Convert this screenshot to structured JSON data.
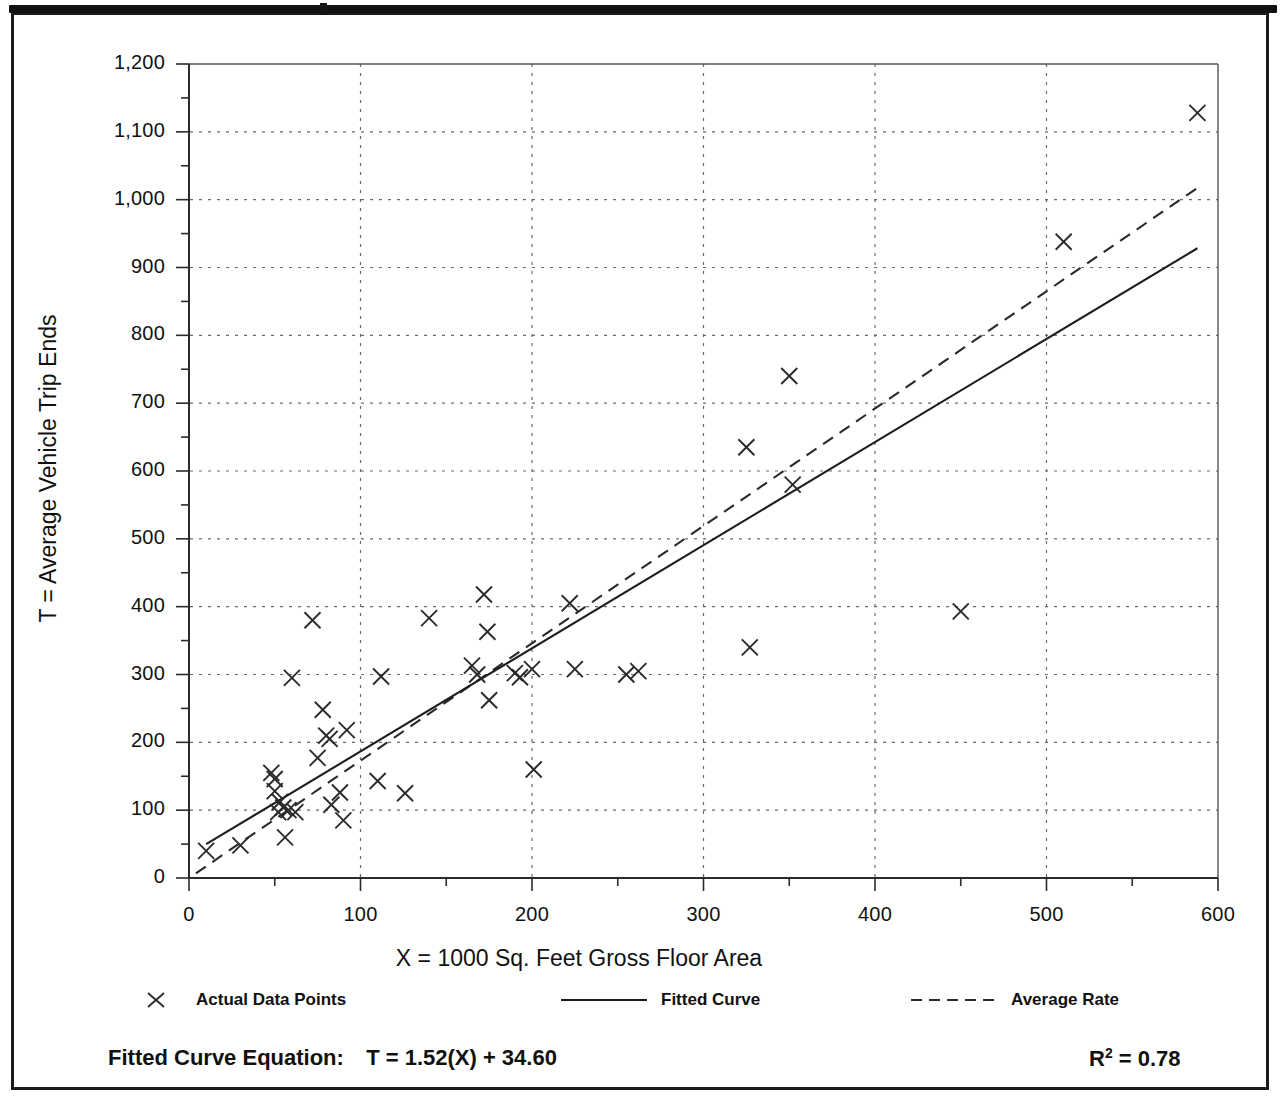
{
  "figure": {
    "frame_color": "#1a1a1a",
    "background": "#ffffff"
  },
  "axes": {
    "y_label": "T = Average Vehicle Trip Ends",
    "x_label": "X = 1000 Sq. Feet Gross Floor Area",
    "y_ticks": [
      "0",
      "100",
      "200",
      "300",
      "400",
      "500",
      "600",
      "700",
      "800",
      "900",
      "1,000",
      "1,100",
      "1,200"
    ],
    "x_ticks": [
      "0",
      "100",
      "200",
      "300",
      "400",
      "500",
      "600"
    ]
  },
  "legend": {
    "items": [
      {
        "label": "Actual Data Points",
        "symbol": "x-marker-icon"
      },
      {
        "label": "Fitted Curve",
        "symbol": "solid-line-icon"
      },
      {
        "label": "Average Rate",
        "symbol": "dashed-line-icon"
      }
    ]
  },
  "annotations": {
    "equation_label": "Fitted Curve Equation:",
    "equation": "T = 1.52(X) + 34.60",
    "r_squared_base": "R",
    "r_squared_exp": "2",
    "r_squared_value": "= 0.78"
  },
  "chart_data": {
    "type": "scatter",
    "title": "",
    "xlabel": "X = 1000 Sq. Feet Gross Floor Area",
    "ylabel": "T = Average Vehicle Trip Ends",
    "xlim": [
      0,
      600
    ],
    "ylim": [
      0,
      1200
    ],
    "x_major_step": 100,
    "y_major_step": 100,
    "x_minor_step": 50,
    "y_minor_step": 50,
    "grid": true,
    "grid_style": "dotted",
    "legend_position": "below-plot",
    "marker": "x",
    "points": [
      [
        10,
        40
      ],
      [
        30,
        48
      ],
      [
        48,
        155
      ],
      [
        50,
        146
      ],
      [
        50,
        128
      ],
      [
        52,
        97
      ],
      [
        53,
        112
      ],
      [
        55,
        104
      ],
      [
        56,
        60
      ],
      [
        58,
        100
      ],
      [
        60,
        295
      ],
      [
        62,
        97
      ],
      [
        72,
        380
      ],
      [
        75,
        177
      ],
      [
        78,
        248
      ],
      [
        80,
        210
      ],
      [
        82,
        205
      ],
      [
        83,
        108
      ],
      [
        88,
        126
      ],
      [
        90,
        85
      ],
      [
        92,
        218
      ],
      [
        110,
        143
      ],
      [
        112,
        297
      ],
      [
        126,
        125
      ],
      [
        140,
        383
      ],
      [
        165,
        313
      ],
      [
        168,
        300
      ],
      [
        172,
        418
      ],
      [
        174,
        363
      ],
      [
        175,
        262
      ],
      [
        190,
        302
      ],
      [
        193,
        296
      ],
      [
        200,
        308
      ],
      [
        201,
        160
      ],
      [
        222,
        405
      ],
      [
        225,
        308
      ],
      [
        255,
        300
      ],
      [
        262,
        305
      ],
      [
        325,
        635
      ],
      [
        327,
        340
      ],
      [
        350,
        740
      ],
      [
        352,
        580
      ],
      [
        450,
        393
      ],
      [
        510,
        938
      ],
      [
        588,
        1128
      ]
    ],
    "series": [
      {
        "name": "Fitted Curve",
        "type": "line",
        "style": "solid",
        "equation": "T = 1.52(X) + 34.60",
        "slope": 1.52,
        "intercept": 34.6,
        "r_squared": 0.78,
        "x_range": [
          10,
          588
        ]
      },
      {
        "name": "Average Rate",
        "type": "line",
        "style": "dashed",
        "slope": 1.73,
        "intercept": 0,
        "x_range": [
          4,
          588
        ]
      }
    ]
  }
}
